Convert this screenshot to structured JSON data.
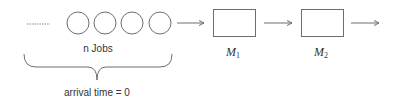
{
  "diagram": {
    "queue": {
      "ellipsis": "……",
      "job_count": 4,
      "label": "n Jobs",
      "brace_label": "arrival time = 0"
    },
    "machines": [
      {
        "name": "M",
        "subscript": "1"
      },
      {
        "name": "M",
        "subscript": "2"
      }
    ],
    "colors": {
      "stroke": "#6e6e6e",
      "text": "#333333",
      "background": "#ffffff"
    }
  }
}
